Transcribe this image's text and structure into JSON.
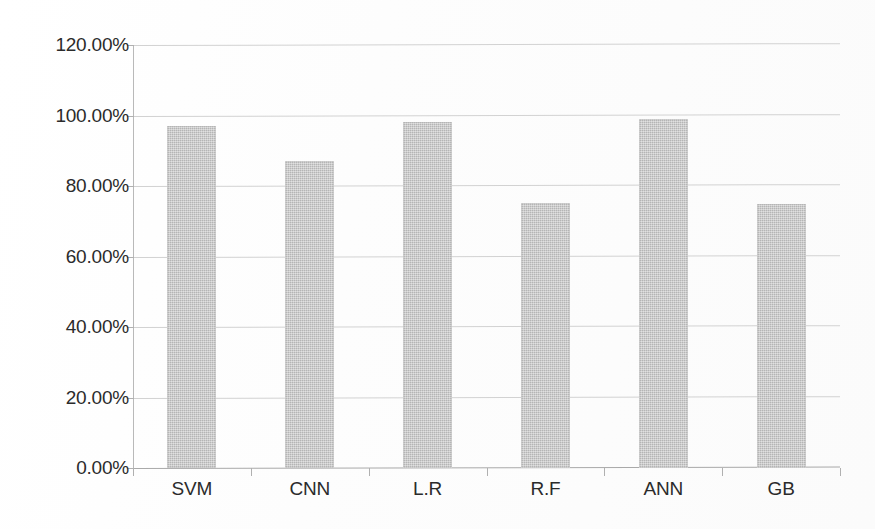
{
  "chart_data": {
    "type": "bar",
    "title": "",
    "subtitle": "",
    "xlabel": "",
    "ylabel": "",
    "categories": [
      "SVM",
      "CNN",
      "L.R",
      "R.F",
      "ANN",
      "GB"
    ],
    "values": [
      97.14,
      87.14,
      98.29,
      75.14,
      99.14,
      74.86
    ],
    "value_labels": [
      "97.14%",
      "87.14%",
      "98.29%",
      "75.14%",
      "99.14%",
      "74.86%"
    ],
    "series": [
      {
        "name": "Accuracy",
        "values": [
          97.14,
          87.14,
          98.29,
          75.14,
          99.14,
          74.86
        ]
      }
    ],
    "ylim": [
      0,
      120
    ],
    "ytick_step": 20,
    "ytick_labels": [
      "0.00%",
      "20.00%",
      "40.00%",
      "60.00%",
      "80.00%",
      "100.00%",
      "120.00%"
    ],
    "ytick_values": [
      0,
      20,
      40,
      60,
      80,
      100,
      120
    ],
    "xtick_labels": [
      "SVM",
      "CNN",
      "L.R",
      "R.F",
      "ANN",
      "GB"
    ],
    "grid": true,
    "grid_axis": "y",
    "legend": false,
    "legend_position": "none",
    "bar_color": "#c6c6c6",
    "axis_color": "#b0b0b0",
    "grid_color": "#d2d2d2",
    "text_color": "#2b2b2b",
    "background_color": "#ffffff",
    "annotations": []
  },
  "figure": {
    "width": 875,
    "height": 529
  }
}
